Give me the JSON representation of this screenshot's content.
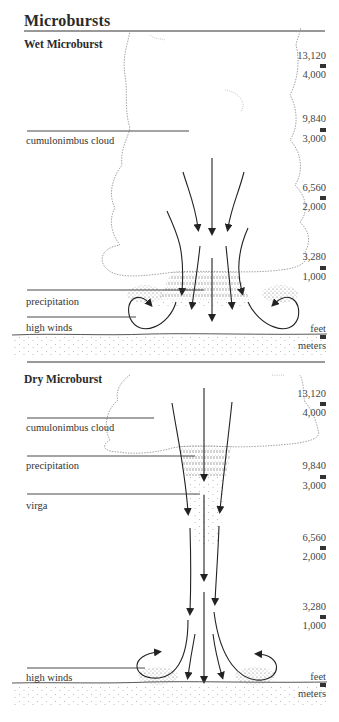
{
  "title": "Microbursts",
  "wet": {
    "heading": "Wet Microburst",
    "labels": {
      "cloud": "cumulonimbus cloud",
      "precipitation": "precipitation",
      "high_winds": "high winds"
    },
    "scale": [
      {
        "feet": "13,120",
        "meters": "4,000"
      },
      {
        "feet": "9,840",
        "meters": "3,000"
      },
      {
        "feet": "6,560",
        "meters": "2,000"
      },
      {
        "feet": "3,280",
        "meters": "1,000"
      }
    ],
    "units": {
      "feet": "feet",
      "meters": "meters"
    }
  },
  "dry": {
    "heading": "Dry Microburst",
    "labels": {
      "cloud": "cumulonimbus cloud",
      "precipitation": "precipitation",
      "virga": "virga",
      "high_winds": "high winds"
    },
    "scale": [
      {
        "feet": "13,120",
        "meters": "4,000"
      },
      {
        "feet": "9,840",
        "meters": "3,000"
      },
      {
        "feet": "6,560",
        "meters": "2,000"
      },
      {
        "feet": "3,280",
        "meters": "1,000"
      }
    ],
    "units": {
      "feet": "feet",
      "meters": "meters"
    }
  }
}
